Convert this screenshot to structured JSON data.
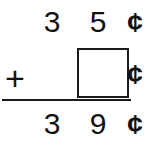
{
  "problem": {
    "type": "vertical-addition",
    "operator": "+",
    "unit_symbol": "¢",
    "rule_color": "#1a1a1a",
    "text_color": "#121212",
    "background_color": "#ffffff",
    "top_addend": {
      "tens": "3",
      "ones": "5",
      "unit": "¢",
      "value": "35"
    },
    "bottom_addend": {
      "operator": "+",
      "answer_box_value": "",
      "unit": "¢",
      "value": ""
    },
    "sum": {
      "tens": "3",
      "ones": "9",
      "unit": "¢",
      "value": "39"
    }
  }
}
